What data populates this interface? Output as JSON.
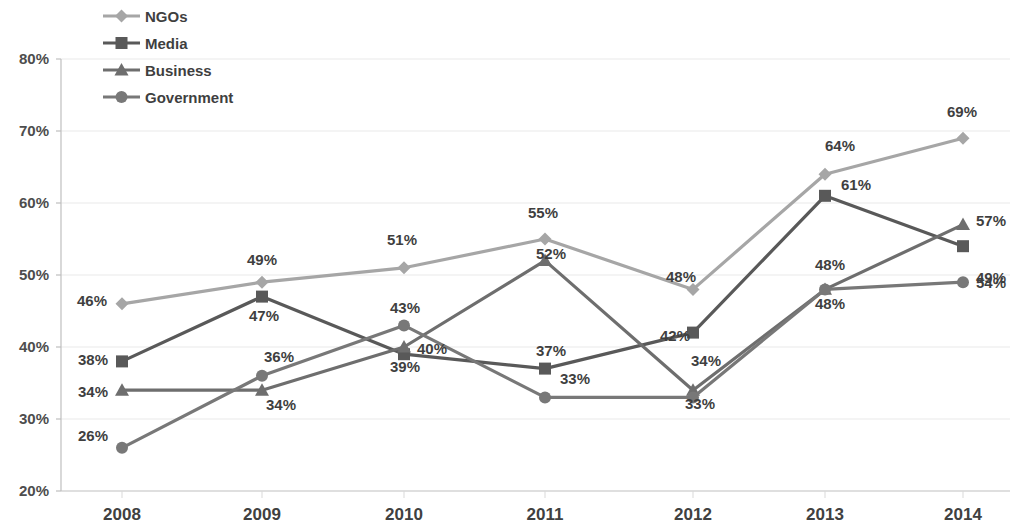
{
  "chart_data": {
    "type": "line",
    "title": "",
    "subtitle": "",
    "xlabel": "",
    "ylabel": "",
    "categories": [
      "2008",
      "2009",
      "2010",
      "2011",
      "2012",
      "2013",
      "2014"
    ],
    "ylim": [
      20,
      80
    ],
    "ytick_labels": [
      "20%",
      "30%",
      "40%",
      "50%",
      "60%",
      "70%",
      "80%"
    ],
    "ytick_values": [
      20,
      30,
      40,
      50,
      60,
      70,
      80
    ],
    "grid": true,
    "legend_position": "top-left",
    "value_suffix": "%",
    "series": [
      {
        "name": "NGOs",
        "marker": "diamond",
        "color": "#a6a6a6",
        "values": [
          46,
          49,
          51,
          55,
          48,
          64,
          69
        ],
        "labels": [
          "46%",
          "49%",
          "51%",
          "55%",
          "48%",
          "64%",
          "69%"
        ]
      },
      {
        "name": "Media",
        "marker": "square",
        "color": "#595959",
        "values": [
          38,
          47,
          39,
          37,
          42,
          61,
          54
        ],
        "labels": [
          "38%",
          "47%",
          "39%",
          "37%",
          "42%",
          "61%",
          "54%"
        ]
      },
      {
        "name": "Business",
        "marker": "triangle",
        "color": "#6e6e6e",
        "values": [
          34,
          34,
          40,
          52,
          34,
          48,
          57
        ],
        "labels": [
          "34%",
          "34%",
          "40%",
          "52%",
          "34%",
          "48%",
          "57%"
        ]
      },
      {
        "name": "Government",
        "marker": "circle",
        "color": "#787878",
        "values": [
          26,
          36,
          43,
          33,
          33,
          48,
          49
        ],
        "labels": [
          "26%",
          "36%",
          "43%",
          "33%",
          "33%",
          "48%",
          "49%"
        ]
      }
    ],
    "label_positions": [
      {
        "series": "NGOs",
        "category": "2008",
        "text": "46%",
        "x": 92,
        "y": 306,
        "anchor": "middle"
      },
      {
        "series": "NGOs",
        "category": "2009",
        "text": "49%",
        "x": 262,
        "y": 265,
        "anchor": "middle"
      },
      {
        "series": "NGOs",
        "category": "2010",
        "text": "51%",
        "x": 402,
        "y": 245,
        "anchor": "middle"
      },
      {
        "series": "NGOs",
        "category": "2011",
        "text": "55%",
        "x": 543,
        "y": 218,
        "anchor": "middle"
      },
      {
        "series": "NGOs",
        "category": "2012",
        "text": "48%",
        "x": 681,
        "y": 282,
        "anchor": "middle"
      },
      {
        "series": "NGOs",
        "category": "2013",
        "text": "64%",
        "x": 840,
        "y": 151,
        "anchor": "middle"
      },
      {
        "series": "NGOs",
        "category": "2014",
        "text": "69%",
        "x": 962,
        "y": 117,
        "anchor": "middle"
      },
      {
        "series": "Media",
        "category": "2008",
        "text": "38%",
        "x": 93,
        "y": 365,
        "anchor": "middle"
      },
      {
        "series": "Media",
        "category": "2009",
        "text": "47%",
        "x": 264,
        "y": 321,
        "anchor": "middle"
      },
      {
        "series": "Media",
        "category": "2010",
        "text": "39%",
        "x": 405,
        "y": 372,
        "anchor": "middle"
      },
      {
        "series": "Media",
        "category": "2011",
        "text": "37%",
        "x": 551,
        "y": 356,
        "anchor": "middle"
      },
      {
        "series": "Media",
        "category": "2012",
        "text": "42%",
        "x": 675,
        "y": 341,
        "anchor": "middle"
      },
      {
        "series": "Media",
        "category": "2013",
        "text": "61%",
        "x": 856,
        "y": 190,
        "anchor": "middle"
      },
      {
        "series": "Media",
        "category": "2014",
        "text": "54%",
        "x": 991,
        "y": 288,
        "anchor": "middle"
      },
      {
        "series": "Business",
        "category": "2008",
        "text": "34%",
        "x": 93,
        "y": 397,
        "anchor": "middle"
      },
      {
        "series": "Business",
        "category": "2009",
        "text": "34%",
        "x": 281,
        "y": 410,
        "anchor": "middle"
      },
      {
        "series": "Business",
        "category": "2010",
        "text": "40%",
        "x": 432,
        "y": 354,
        "anchor": "middle"
      },
      {
        "series": "Business",
        "category": "2011",
        "text": "52%",
        "x": 551,
        "y": 259,
        "anchor": "middle"
      },
      {
        "series": "Business",
        "category": "2012",
        "text": "34%",
        "x": 706,
        "y": 366,
        "anchor": "middle"
      },
      {
        "series": "Business",
        "category": "2013",
        "text": "48%",
        "x": 830,
        "y": 270,
        "anchor": "middle"
      },
      {
        "series": "Business",
        "category": "2014",
        "text": "57%",
        "x": 991,
        "y": 226,
        "anchor": "middle"
      },
      {
        "series": "Government",
        "category": "2008",
        "text": "26%",
        "x": 93,
        "y": 441,
        "anchor": "middle"
      },
      {
        "series": "Government",
        "category": "2009",
        "text": "36%",
        "x": 279,
        "y": 362,
        "anchor": "middle"
      },
      {
        "series": "Government",
        "category": "2010",
        "text": "43%",
        "x": 405,
        "y": 313,
        "anchor": "middle"
      },
      {
        "series": "Government",
        "category": "2011",
        "text": "33%",
        "x": 575,
        "y": 384,
        "anchor": "middle"
      },
      {
        "series": "Government",
        "category": "2012",
        "text": "33%",
        "x": 700,
        "y": 409,
        "anchor": "middle"
      },
      {
        "series": "Government",
        "category": "2013",
        "text": "48%",
        "x": 830,
        "y": 309,
        "anchor": "middle"
      },
      {
        "series": "Government",
        "category": "2014",
        "text": "49%",
        "x": 991,
        "y": 283,
        "anchor": "middle"
      }
    ]
  },
  "legend": {
    "items": [
      {
        "label": "NGOs",
        "color": "#a6a6a6",
        "marker": "diamond"
      },
      {
        "label": "Media",
        "color": "#595959",
        "marker": "square"
      },
      {
        "label": "Business",
        "color": "#6e6e6e",
        "marker": "triangle"
      },
      {
        "label": "Government",
        "color": "#787878",
        "marker": "circle"
      }
    ]
  }
}
